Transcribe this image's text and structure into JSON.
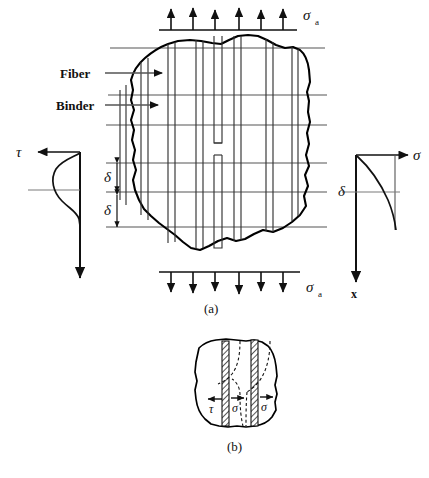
{
  "figure": {
    "title_hidden": "Fiber-reinforced composite stress distribution diagram",
    "panels": [
      {
        "id": "a",
        "caption": "(a)"
      },
      {
        "id": "b",
        "caption": "(b)"
      }
    ]
  },
  "panel_a": {
    "caption": "(a)",
    "top_load": {
      "symbol": "σ",
      "subscript": "a",
      "arrow_count": 6,
      "direction": "up"
    },
    "bottom_load": {
      "symbol": "σ",
      "subscript": "a",
      "arrow_count": 6,
      "direction": "down"
    },
    "callouts": [
      {
        "label": "Fiber",
        "points_to": "fiber-line"
      },
      {
        "label": "Binder",
        "points_to": "binder-region"
      }
    ],
    "dimensions": [
      {
        "label": "δ",
        "name": "delta-upper"
      },
      {
        "label": "δ",
        "name": "delta-lower"
      }
    ],
    "left_plot": {
      "axis_label": "τ",
      "curve_name": "shear-stress-profile",
      "axis_direction": "vertical-down"
    },
    "right_plot": {
      "axis_label": "σ",
      "vertical_axis_label": "x",
      "delta_label": "δ",
      "curve_name": "normal-stress-profile"
    },
    "gridline_count": 6,
    "fiber_pair_count": 7
  },
  "panel_b": {
    "caption": "(b)",
    "labels": [
      {
        "symbol": "τ",
        "name": "shear-stress-label",
        "arrow": "left"
      },
      {
        "symbol": "σ",
        "name": "normal-stress-label-left",
        "arrow": "right"
      },
      {
        "symbol": "σ",
        "name": "normal-stress-label-right",
        "arrow": "right"
      }
    ],
    "fiber_band_count": 2
  },
  "colors": {
    "ink": "#1a1a1a",
    "grid": "#4a4a4a",
    "outline": "#000000",
    "background": "#ffffff"
  }
}
